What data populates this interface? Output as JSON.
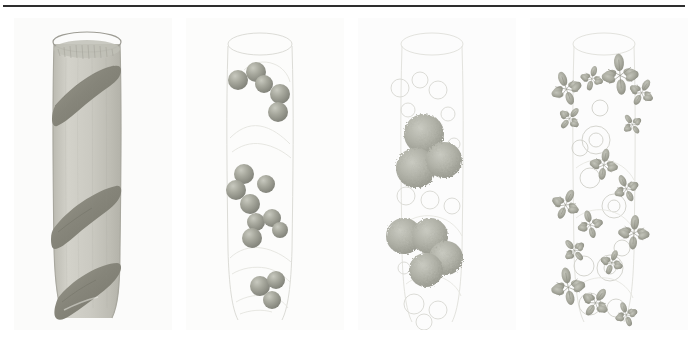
{
  "figure": {
    "domain": "scientific-illustration",
    "width": 698,
    "height": 341,
    "background_color": "#ffffff",
    "rule": {
      "color": "#2e2e2e",
      "x": 3,
      "y": 5,
      "width": 682,
      "thickness": 2
    },
    "panel_count": 4,
    "panel_layout": {
      "top": 18,
      "height": 312,
      "panel_width": 158,
      "gutter": 14,
      "lefts": [
        14,
        186,
        358,
        530
      ]
    }
  },
  "panels": [
    {
      "id": "panel-1",
      "name": "stem-with-spiral-band",
      "background": "#fbfbfa",
      "description": "Shaded vertical cylindrical stem with an elliptical open rim at top and a dark olive band spiralling around it",
      "colors": {
        "stem_fill": "#c9c8c0",
        "stem_fill_light": "#d5d4cc",
        "stem_fill_dark": "#bab9b0",
        "rim_stroke": "#9a9a92",
        "band_fill": "#8e8d81",
        "band_fill_dark": "#7d7c70",
        "outline": "#a5a49b"
      },
      "stem": {
        "top_y": 22,
        "bottom_y": 300,
        "left_x": 40,
        "right_x": 106,
        "rim_cx": 73,
        "rim_cy": 24,
        "rim_rx": 34,
        "rim_ry": 10
      },
      "spiral_bands": [
        {
          "label": "band-upper",
          "y_center": 78,
          "tilt": -28
        },
        {
          "label": "band-middle",
          "y_center": 196,
          "tilt": -26
        },
        {
          "label": "band-lower",
          "y_center": 268,
          "tilt": -24
        }
      ]
    },
    {
      "id": "panel-2",
      "name": "stem-with-sparse-spheres",
      "background": "#fcfcfb",
      "description": "Faint outlined stem overlaid with discrete shaded spheres clustered in two groups",
      "colors": {
        "outline": "#d9d9d4",
        "outline_soft": "#e4e4df",
        "sphere_fill": "#a2a398",
        "sphere_highlight": "#c3c4ba",
        "sphere_shadow": "#85867c"
      },
      "sphere_radius_range": [
        7,
        11
      ],
      "spheres": [
        {
          "cx": 52,
          "cy": 62,
          "r": 10
        },
        {
          "cx": 70,
          "cy": 54,
          "r": 10
        },
        {
          "cx": 78,
          "cy": 66,
          "r": 9
        },
        {
          "cx": 94,
          "cy": 76,
          "r": 10
        },
        {
          "cx": 92,
          "cy": 94,
          "r": 10
        },
        {
          "cx": 58,
          "cy": 156,
          "r": 10
        },
        {
          "cx": 50,
          "cy": 172,
          "r": 10
        },
        {
          "cx": 80,
          "cy": 166,
          "r": 9
        },
        {
          "cx": 64,
          "cy": 186,
          "r": 10
        },
        {
          "cx": 70,
          "cy": 204,
          "r": 9
        },
        {
          "cx": 86,
          "cy": 200,
          "r": 9
        },
        {
          "cx": 94,
          "cy": 212,
          "r": 8
        },
        {
          "cx": 66,
          "cy": 220,
          "r": 10
        },
        {
          "cx": 74,
          "cy": 268,
          "r": 10
        },
        {
          "cx": 90,
          "cy": 262,
          "r": 9
        },
        {
          "cx": 86,
          "cy": 282,
          "r": 9
        }
      ]
    },
    {
      "id": "panel-3",
      "name": "stem-with-clustered-aggregates",
      "background": "#fcfcfc",
      "description": "Very faint stem outline with small ring motifs and four to six large textured spherical aggregates",
      "colors": {
        "outline": "#e2e2de",
        "ring_stroke": "#dcdcd7",
        "cluster_fill": "#b0b1a7",
        "cluster_texture": "#9b9c92"
      },
      "clusters": [
        {
          "cx": 66,
          "cy": 116,
          "r": 20
        },
        {
          "cx": 58,
          "cy": 150,
          "r": 20
        },
        {
          "cx": 86,
          "cy": 142,
          "r": 18
        },
        {
          "cx": 46,
          "cy": 218,
          "r": 18
        },
        {
          "cx": 72,
          "cy": 218,
          "r": 18
        },
        {
          "cx": 88,
          "cy": 240,
          "r": 17
        },
        {
          "cx": 68,
          "cy": 252,
          "r": 17
        }
      ],
      "rings": [
        {
          "cx": 42,
          "cy": 70,
          "r": 9
        },
        {
          "cx": 62,
          "cy": 62,
          "r": 8
        },
        {
          "cx": 80,
          "cy": 72,
          "r": 9
        },
        {
          "cx": 50,
          "cy": 92,
          "r": 7
        },
        {
          "cx": 90,
          "cy": 96,
          "r": 7
        },
        {
          "cx": 48,
          "cy": 178,
          "r": 9
        },
        {
          "cx": 72,
          "cy": 182,
          "r": 9
        },
        {
          "cx": 94,
          "cy": 188,
          "r": 8
        },
        {
          "cx": 56,
          "cy": 286,
          "r": 10
        },
        {
          "cx": 80,
          "cy": 292,
          "r": 9
        },
        {
          "cx": 66,
          "cy": 304,
          "r": 8
        }
      ]
    },
    {
      "id": "panel-4",
      "name": "stem-with-foliage-clusters",
      "background": "#fcfcfc",
      "description": "Faint stem outline densely overlaid with small leaf-like foliage sprays and rosette motifs",
      "colors": {
        "outline": "#e3e3de",
        "leaf_fill": "#a8a99e",
        "leaf_fill_light": "#c2c3b9",
        "leaf_stroke": "#90917f",
        "rosette_stroke": "#d5d5cf"
      },
      "foliage_clusters": [
        {
          "cx": 36,
          "cy": 70,
          "size": 22,
          "rot": -20
        },
        {
          "cx": 62,
          "cy": 60,
          "size": 16,
          "rot": 15
        },
        {
          "cx": 90,
          "cy": 56,
          "size": 26,
          "rot": -5
        },
        {
          "cx": 112,
          "cy": 74,
          "size": 18,
          "rot": 30
        },
        {
          "cx": 40,
          "cy": 100,
          "size": 16,
          "rot": 40
        },
        {
          "cx": 102,
          "cy": 106,
          "size": 14,
          "rot": -35
        },
        {
          "cx": 74,
          "cy": 146,
          "size": 20,
          "rot": 10
        },
        {
          "cx": 96,
          "cy": 170,
          "size": 18,
          "rot": -25
        },
        {
          "cx": 36,
          "cy": 186,
          "size": 20,
          "rot": 25
        },
        {
          "cx": 60,
          "cy": 206,
          "size": 18,
          "rot": -15
        },
        {
          "cx": 104,
          "cy": 214,
          "size": 22,
          "rot": 5
        },
        {
          "cx": 44,
          "cy": 232,
          "size": 16,
          "rot": -40
        },
        {
          "cx": 82,
          "cy": 244,
          "size": 16,
          "rot": 20
        },
        {
          "cx": 38,
          "cy": 268,
          "size": 24,
          "rot": -10
        },
        {
          "cx": 66,
          "cy": 284,
          "size": 20,
          "rot": 35
        },
        {
          "cx": 96,
          "cy": 296,
          "size": 16,
          "rot": -20
        }
      ],
      "rosettes": [
        {
          "cx": 66,
          "cy": 122,
          "r": 14
        },
        {
          "cx": 84,
          "cy": 188,
          "r": 12
        },
        {
          "cx": 60,
          "cy": 160,
          "r": 10
        },
        {
          "cx": 80,
          "cy": 250,
          "r": 13
        },
        {
          "cx": 54,
          "cy": 248,
          "r": 10
        }
      ]
    }
  ]
}
